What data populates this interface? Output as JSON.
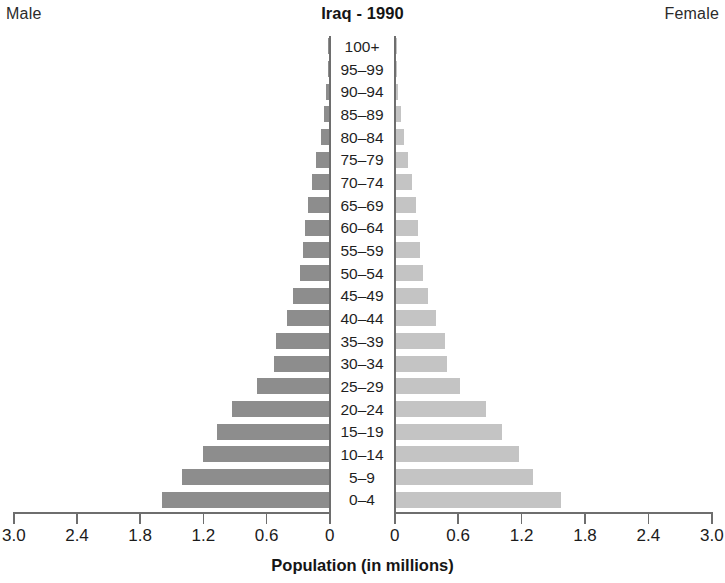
{
  "header": {
    "male_label": "Male",
    "female_label": "Female",
    "title": "Iraq - 1990"
  },
  "axis": {
    "title": "Population (in millions)",
    "left_ticks": [
      "3.0",
      "2.4",
      "1.8",
      "1.2",
      "0.6",
      "0"
    ],
    "right_ticks": [
      "0",
      "0.6",
      "1.2",
      "1.8",
      "2.4",
      "3.0"
    ]
  },
  "chart_data": {
    "type": "bar",
    "subtype": "population-pyramid",
    "title": "Iraq - 1990",
    "xlabel": "Population (in millions)",
    "ylabel": "",
    "xlim": [
      0,
      3.0
    ],
    "xticks": [
      0,
      0.6,
      1.2,
      1.8,
      2.4,
      3.0
    ],
    "grid": false,
    "legend": [
      "Male",
      "Female"
    ],
    "legend_position": "top-left and top-right",
    "categories": [
      "100+",
      "95-99",
      "90-94",
      "85-89",
      "80-84",
      "75-79",
      "70-74",
      "65-69",
      "60-64",
      "55-59",
      "50-54",
      "45-49",
      "40-44",
      "35-39",
      "30-34",
      "25-29",
      "20-24",
      "15-19",
      "10-14",
      "5-9",
      "0-4"
    ],
    "series": [
      {
        "name": "Male",
        "direction": "left",
        "color": "#8d8d8d",
        "values": [
          0.004,
          0.012,
          0.025,
          0.048,
          0.08,
          0.12,
          0.16,
          0.2,
          0.23,
          0.25,
          0.28,
          0.34,
          0.4,
          0.5,
          0.52,
          0.68,
          0.92,
          1.06,
          1.2,
          1.4,
          1.59
        ]
      },
      {
        "name": "Female",
        "direction": "right",
        "color": "#c4c4c4",
        "values": [
          0.004,
          0.012,
          0.025,
          0.048,
          0.08,
          0.12,
          0.16,
          0.19,
          0.21,
          0.23,
          0.26,
          0.31,
          0.38,
          0.47,
          0.49,
          0.61,
          0.86,
          1.01,
          1.17,
          1.3,
          1.57
        ]
      }
    ]
  }
}
